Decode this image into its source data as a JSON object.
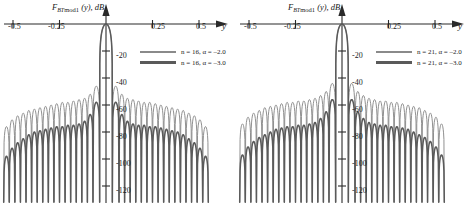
{
  "figure": {
    "panel_count": 2,
    "background_color": "#ffffff",
    "curve_color_thin": "#8a8a8a",
    "curve_color_thick": "#5a5a5a",
    "axis_color": "#2a2a2a"
  },
  "panels": [
    {
      "id": "left",
      "ylabel_prefix": "F",
      "ylabel_sub": "BT",
      "ylabel_sub2": "mod1",
      "ylabel_arg": "(y), dB",
      "xaxis_var": "y",
      "legend": [
        {
          "text": "n = 16, α = –2.0",
          "style": "thin"
        },
        {
          "text": "n = 16, α = –3.0",
          "style": "thick"
        }
      ]
    },
    {
      "id": "right",
      "ylabel_prefix": "F",
      "ylabel_sub": "BT",
      "ylabel_sub2": "mod1",
      "ylabel_arg": "(y), dB",
      "xaxis_var": "y",
      "legend": [
        {
          "text": "n = 21, α = –2.0",
          "style": "thin"
        },
        {
          "text": "n = 21, α = –3.0",
          "style": "thick"
        }
      ]
    }
  ],
  "ticks": {
    "x": [
      "-0.5",
      "-0.25",
      "0.25",
      "0.5"
    ],
    "y": [
      "-20",
      "-40",
      "-60",
      "-80",
      "-100",
      "-120"
    ]
  },
  "chart_data": [
    {
      "type": "line",
      "title": "F_BTmod1 (y), dB  —  n = 16",
      "xlabel": "y",
      "ylabel": "F_BTmod1 (y), dB",
      "xlim": [
        -0.62,
        0.62
      ],
      "ylim": [
        -130,
        0
      ],
      "xticks": [
        -0.5,
        -0.25,
        0.25,
        0.5
      ],
      "yticks": [
        -20,
        -40,
        -60,
        -80,
        -100,
        -120
      ],
      "grid": false,
      "legend_position": "upper-right-inside",
      "series": [
        {
          "name": "n = 16, α = -2.0",
          "style": "thin",
          "color": "#8a8a8a",
          "mainlobe_peak_y": 0.0,
          "mainlobe_peak_value": 0,
          "sidelobe_peaks_y": [
            0.055,
            0.085,
            0.115,
            0.145,
            0.175,
            0.205,
            0.235,
            0.265,
            0.295,
            0.325,
            0.355,
            0.385,
            0.415,
            0.445,
            0.475,
            0.505,
            0.535
          ],
          "sidelobe_peaks_db": [
            -46,
            -52,
            -55,
            -56,
            -57,
            -58,
            -58,
            -59,
            -60,
            -61,
            -62,
            -63,
            -64,
            -66,
            -68,
            -71,
            -76
          ]
        },
        {
          "name": "n = 16, α = -3.0",
          "style": "thick",
          "color": "#5a5a5a",
          "mainlobe_peak_y": 0.0,
          "mainlobe_peak_value": 0,
          "sidelobe_peaks_y": [
            0.055,
            0.085,
            0.115,
            0.145,
            0.175,
            0.205,
            0.235,
            0.265,
            0.295,
            0.325,
            0.355,
            0.385,
            0.415,
            0.445,
            0.475,
            0.505,
            0.535
          ],
          "sidelobe_peaks_db": [
            -58,
            -67,
            -72,
            -74,
            -75,
            -75,
            -76,
            -76,
            -77,
            -78,
            -79,
            -80,
            -82,
            -85,
            -88,
            -92,
            -98
          ]
        }
      ]
    },
    {
      "type": "line",
      "title": "F_BTmod1 (y), dB  —  n = 21",
      "xlabel": "y",
      "ylabel": "F_BTmod1 (y), dB",
      "xlim": [
        -0.62,
        0.62
      ],
      "ylim": [
        -130,
        0
      ],
      "xticks": [
        -0.5,
        -0.25,
        0.25,
        0.5
      ],
      "yticks": [
        -20,
        -40,
        -60,
        -80,
        -100,
        -120
      ],
      "grid": false,
      "legend_position": "upper-right-inside",
      "series": [
        {
          "name": "n = 21, α = -2.0",
          "style": "thin",
          "color": "#8a8a8a",
          "mainlobe_peak_y": 0.0,
          "mainlobe_peak_value": 0,
          "sidelobe_peaks_y": [
            0.055,
            0.085,
            0.115,
            0.145,
            0.175,
            0.205,
            0.235,
            0.265,
            0.295,
            0.325,
            0.355,
            0.385,
            0.415,
            0.445,
            0.475,
            0.505,
            0.535
          ],
          "sidelobe_peaks_db": [
            -44,
            -50,
            -53,
            -55,
            -56,
            -57,
            -57,
            -58,
            -58,
            -59,
            -60,
            -61,
            -62,
            -64,
            -66,
            -69,
            -74
          ]
        },
        {
          "name": "n = 21, α = -3.0",
          "style": "thick",
          "color": "#5a5a5a",
          "mainlobe_peak_y": 0.0,
          "mainlobe_peak_value": 0,
          "sidelobe_peaks_y": [
            0.055,
            0.085,
            0.115,
            0.145,
            0.175,
            0.205,
            0.235,
            0.265,
            0.295,
            0.325,
            0.355,
            0.385,
            0.415,
            0.445,
            0.475,
            0.505,
            0.535
          ],
          "sidelobe_peaks_db": [
            -56,
            -65,
            -70,
            -73,
            -74,
            -75,
            -75,
            -76,
            -76,
            -77,
            -78,
            -80,
            -82,
            -84,
            -87,
            -91,
            -97
          ]
        }
      ]
    }
  ]
}
